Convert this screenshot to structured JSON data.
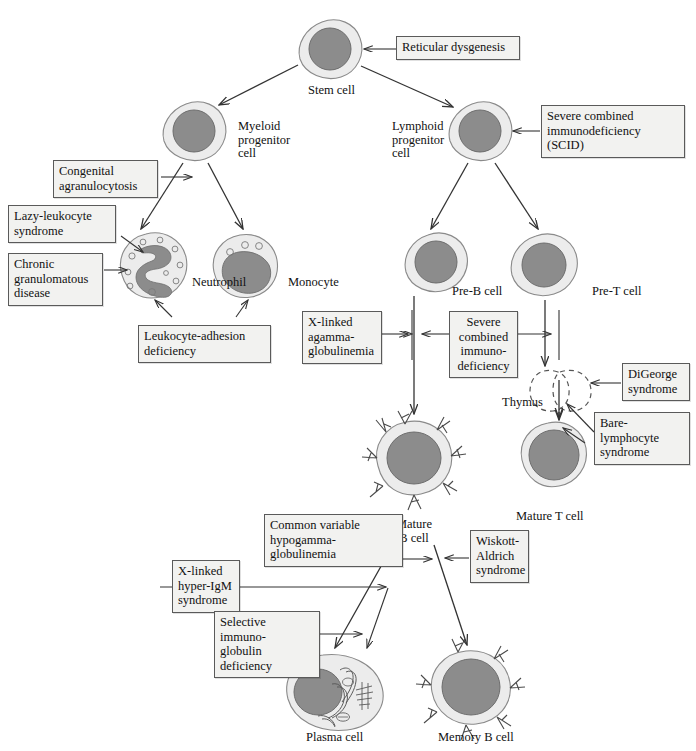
{
  "figure": {
    "type": "biology-flow-diagram",
    "background_color": "#ffffff",
    "cell_cytoplasm_color": "#ececec",
    "cell_nucleus_color": "#8c8c8c",
    "box_fill_color": "#f2f2f0",
    "box_border_color": "#5a5a5a",
    "line_color": "#333333"
  },
  "cells": [
    {
      "id": "stem-cell",
      "label": "Stem cell"
    },
    {
      "id": "myeloid-progenitor-cell",
      "label": "Myeloid\nprogenitor\ncell"
    },
    {
      "id": "lymphoid-progenitor-cell",
      "label": "Lymphoid\nprogenitor\ncell"
    },
    {
      "id": "neutrophil",
      "label": "Neutrophil"
    },
    {
      "id": "monocyte",
      "label": "Monocyte"
    },
    {
      "id": "pre-b-cell",
      "label": "Pre-B cell"
    },
    {
      "id": "pre-t-cell",
      "label": "Pre-T cell"
    },
    {
      "id": "thymus",
      "label": "Thymus"
    },
    {
      "id": "mature-b-cell",
      "label": "Mature\nB cell"
    },
    {
      "id": "mature-t-cell",
      "label": "Mature T cell"
    },
    {
      "id": "plasma-cell",
      "label": "Plasma cell"
    },
    {
      "id": "memory-b-cell",
      "label": "Memory B cell"
    }
  ],
  "diseases": [
    {
      "id": "reticular-dysgenesis",
      "label": "Reticular dysgenesis",
      "targets": "stem-cell"
    },
    {
      "id": "severe-combined-immunodeficiency-scid",
      "label": "Severe combined\nimmunodeficiency\n(SCID)",
      "targets": "lymphoid-progenitor-cell"
    },
    {
      "id": "congenital-agranulocytosis",
      "label": "Congenital\nagranulocytosis",
      "targets": "neutrophil-pathway"
    },
    {
      "id": "lazy-leukocyte-syndrome",
      "label": "Lazy-leukocyte\nsyndrome",
      "targets": "neutrophil"
    },
    {
      "id": "chronic-granulomatous-disease",
      "label": "Chronic\ngranulomatous\ndisease",
      "targets": "neutrophil"
    },
    {
      "id": "leukocyte-adhesion-deficiency",
      "label": "Leukocyte-adhesion\ndeficiency",
      "targets": "neutrophil-and-monocyte"
    },
    {
      "id": "x-linked-agammaglobulinemia",
      "label": "X-linked\nagamma-\nglobulinemia",
      "targets": "pre-b-cell-pathway"
    },
    {
      "id": "severe-combined-immunodeficiency",
      "label": "Severe\ncombined\nimmuno-\ndeficiency",
      "targets": "pre-b-and-pre-t-pathways"
    },
    {
      "id": "digeorge-syndrome",
      "label": "DiGeorge\nsyndrome",
      "targets": "thymus"
    },
    {
      "id": "bare-lymphocyte-syndrome",
      "label": "Bare-lymphocyte\nsyndrome",
      "targets": "thymus-and-mature-t-pathway"
    },
    {
      "id": "common-variable-hypogammaglobulinemia",
      "label": "Common variable\nhypogamma-\nglobulinemia",
      "targets": "mature-b-cell"
    },
    {
      "id": "wiskott-aldrich-syndrome",
      "label": "Wiskott-\nAldrich\nsyndrome",
      "targets": "mature-b-cell"
    },
    {
      "id": "x-linked-hyper-igm-syndrome",
      "label": "X-linked\nhyper-IgM\nsyndrome",
      "targets": "plasma-cell-pathway"
    },
    {
      "id": "selective-immunoglobulin-deficiency",
      "label": "Selective immuno-\nglobulin\ndeficiency",
      "targets": "plasma-cell-pathway"
    }
  ]
}
